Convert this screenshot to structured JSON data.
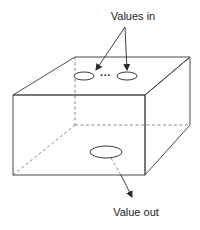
{
  "diagram": {
    "labels": {
      "inputs": "Values in",
      "output": "Value out",
      "ellipsis": "···"
    },
    "colors": {
      "stroke": "#4a4a4a",
      "text": "#222222",
      "background": "#ffffff"
    }
  }
}
